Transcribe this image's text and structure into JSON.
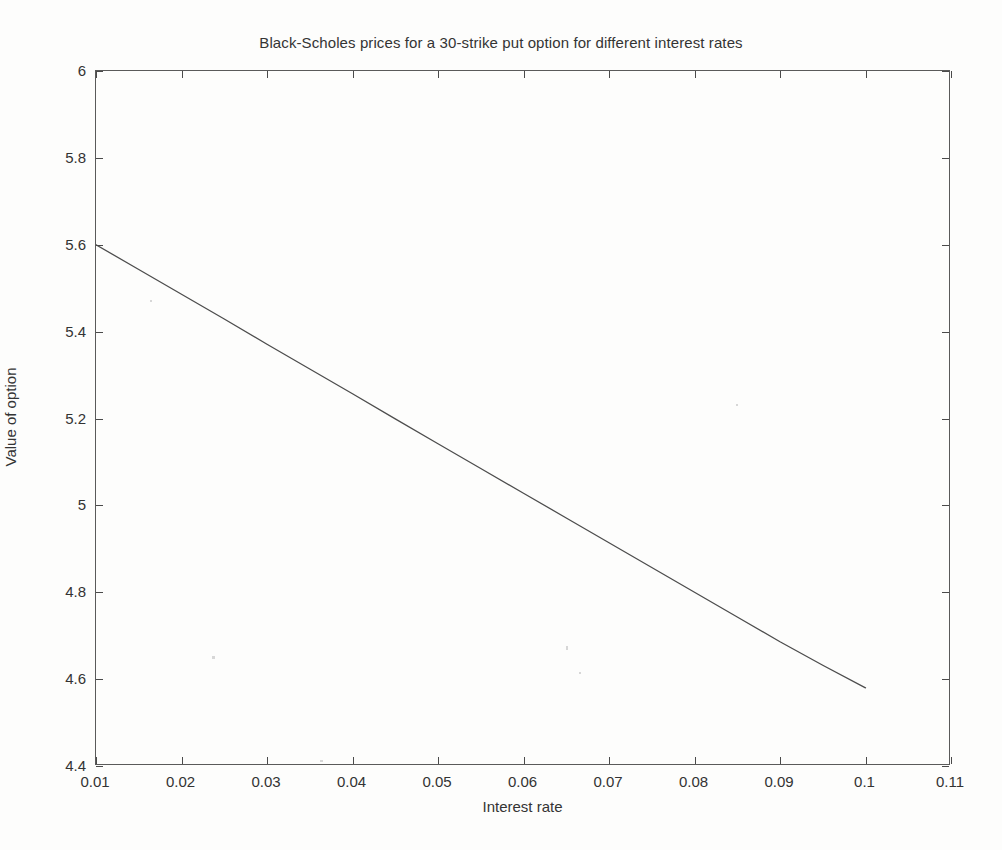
{
  "figure": {
    "title": "Black-Scholes prices for a 30-strike put option for different interest rates",
    "x_axis_title": "Interest rate",
    "y_axis_title": "Value of option"
  },
  "chart_data": {
    "type": "line",
    "title": "Black-Scholes prices for a 30-strike put option for different interest rates",
    "xlabel": "Interest rate",
    "ylabel": "Value of option",
    "xlim": [
      0.01,
      0.11
    ],
    "ylim": [
      4.4,
      6.0
    ],
    "xticks": [
      0.01,
      0.02,
      0.03,
      0.04,
      0.05,
      0.06,
      0.07,
      0.08,
      0.09,
      0.1,
      0.11
    ],
    "xtick_labels": [
      "0.01",
      "0.02",
      "0.03",
      "0.04",
      "0.05",
      "0.06",
      "0.07",
      "0.08",
      "0.09",
      "0.1",
      "0.11"
    ],
    "yticks": [
      4.4,
      4.6,
      4.8,
      5.0,
      5.2,
      5.4,
      5.6,
      5.8,
      6.0
    ],
    "ytick_labels": [
      "4.4",
      "4.6",
      "4.8",
      "5",
      "5.2",
      "5.4",
      "5.6",
      "5.8",
      "6"
    ],
    "grid": false,
    "legend": null,
    "line_color": "#4d4d4d",
    "series": [
      {
        "name": "Black-Scholes put price",
        "x": [
          0.01,
          0.015,
          0.02,
          0.025,
          0.03,
          0.035,
          0.04,
          0.045,
          0.05,
          0.055,
          0.06,
          0.065,
          0.07,
          0.075,
          0.08,
          0.085,
          0.09,
          0.095,
          0.1
        ],
        "values": [
          5.6,
          5.543,
          5.486,
          5.429,
          5.371,
          5.314,
          5.257,
          5.199,
          5.142,
          5.085,
          5.028,
          4.971,
          4.914,
          4.857,
          4.8,
          4.743,
          4.686,
          4.632,
          4.58
        ]
      }
    ]
  }
}
